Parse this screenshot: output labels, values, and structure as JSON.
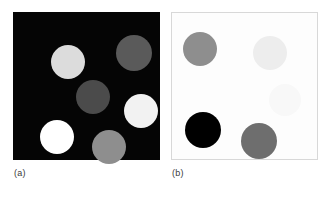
{
  "figure": {
    "background": "#ffffff",
    "width": 331,
    "height": 198
  },
  "panels": [
    {
      "id": "a",
      "caption": "(a)",
      "background": "#050505",
      "border": "none",
      "x": 13,
      "y": 12,
      "w": 147,
      "h": 148,
      "description": "grayscale disks on black background",
      "blobs": [
        {
          "name": "disk-top-left",
          "cx": 55,
          "cy": 50,
          "r": 17,
          "color": "#dcdcdc",
          "gray_level": 220
        },
        {
          "name": "disk-top-right",
          "cx": 121,
          "cy": 41,
          "r": 18,
          "color": "#5a5a5a",
          "gray_level": 90
        },
        {
          "name": "disk-center",
          "cx": 80,
          "cy": 85,
          "r": 17,
          "color": "#4b4b4b",
          "gray_level": 75
        },
        {
          "name": "disk-middle-right",
          "cx": 128,
          "cy": 99,
          "r": 17,
          "color": "#f2f2f2",
          "gray_level": 242
        },
        {
          "name": "disk-bottom-left",
          "cx": 44,
          "cy": 125,
          "r": 17,
          "color": "#ffffff",
          "gray_level": 255
        },
        {
          "name": "disk-bottom-mid",
          "cx": 96,
          "cy": 135,
          "r": 17,
          "color": "#8e8e8e",
          "gray_level": 142
        }
      ]
    },
    {
      "id": "b",
      "caption": "(b)",
      "background": "#fdfdfd",
      "border": "#d8d8d8",
      "x": 171,
      "y": 12,
      "w": 147,
      "h": 148,
      "description": "complementary grayscale disks on white background",
      "blobs": [
        {
          "name": "disk-top-left",
          "cx": 28,
          "cy": 36,
          "r": 17,
          "color": "#8e8e8e",
          "gray_level": 142
        },
        {
          "name": "disk-top-right",
          "cx": 98,
          "cy": 40,
          "r": 17,
          "color": "#ededed",
          "gray_level": 237
        },
        {
          "name": "disk-middle-right",
          "cx": 113,
          "cy": 87,
          "r": 16,
          "color": "#f8f8f8",
          "gray_level": 248
        },
        {
          "name": "disk-bottom-left",
          "cx": 31,
          "cy": 117,
          "r": 18,
          "color": "#000000",
          "gray_level": 0
        },
        {
          "name": "disk-bottom-mid",
          "cx": 87,
          "cy": 128,
          "r": 18,
          "color": "#6e6e6e",
          "gray_level": 110
        }
      ]
    }
  ]
}
